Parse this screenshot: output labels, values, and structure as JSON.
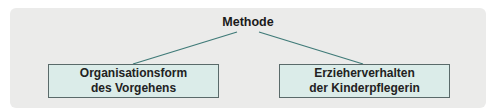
{
  "diagram": {
    "root": {
      "label": "Methode"
    },
    "children": [
      {
        "line1": "Organisationsform",
        "line2": "des Vorgehens"
      },
      {
        "line1": "Erzieherverhalten",
        "line2": "der Kinderpflegerin"
      }
    ],
    "colors": {
      "panel": "#ebebea",
      "box_fill": "#dbece9",
      "box_border": "#5a6a6a",
      "connector": "#3f7a78"
    }
  }
}
